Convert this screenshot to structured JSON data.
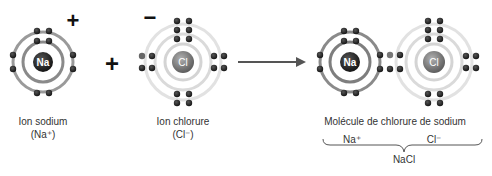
{
  "sodium_ion": {
    "symbol": "Na",
    "charge": "+",
    "label": "Ion sodium",
    "formula": "(Na⁺)"
  },
  "plus_sign": "+",
  "chloride_ion": {
    "symbol": "Cl",
    "charge": "−",
    "label": "Ion chlorure",
    "formula": "(Cl⁻)"
  },
  "molecule": {
    "na_symbol": "Na",
    "cl_symbol": "Cl",
    "label": "Molécule de chlorure de sodium",
    "na_part": "Na⁺",
    "cl_part": "Cl⁻",
    "formula": "NaCl"
  },
  "colors": {
    "na_nucleus": "#2a2a2a",
    "cl_nucleus": "#7a7a7a",
    "na_ring": "#8a8a8a",
    "cl_ring": "#dcdcdc",
    "electron": "#1e1e1e"
  }
}
